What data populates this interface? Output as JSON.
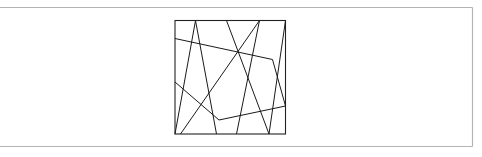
{
  "figure": {
    "frame": {
      "x1": 0,
      "y1": 7.5,
      "x2": 472.5,
      "y2": 146.5,
      "color": "#b4b4b4"
    },
    "square": {
      "x": 175,
      "y": 20.5,
      "width": 110.5,
      "height": 113.5,
      "color": "#222222"
    },
    "stroke_color": "#1a1a1a",
    "segments": [
      {
        "x1": 195.5,
        "y1": 20.5,
        "x2": 175,
        "y2": 134
      },
      {
        "x1": 195.5,
        "y1": 20.5,
        "x2": 216.5,
        "y2": 134
      },
      {
        "x1": 226.5,
        "y1": 20.5,
        "x2": 269,
        "y2": 134
      },
      {
        "x1": 259.5,
        "y1": 20.5,
        "x2": 236.5,
        "y2": 134
      },
      {
        "x1": 259.5,
        "y1": 20.5,
        "x2": 180.5,
        "y2": 134
      },
      {
        "x1": 285.5,
        "y1": 20.5,
        "x2": 269,
        "y2": 134
      }
    ],
    "polylines": [
      {
        "points": "175,38.5 272.5,59.5 285.5,106"
      },
      {
        "points": "175,82 219,120 285.5,106"
      }
    ]
  }
}
